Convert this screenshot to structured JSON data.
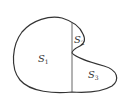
{
  "diagram": {
    "stroke_color": "#333333",
    "background": "#ffffff",
    "regions": [
      {
        "id": "S1",
        "base": "S",
        "sub": "1",
        "x": 38,
        "y": 62
      },
      {
        "id": "S2",
        "base": "S",
        "sub": "2",
        "x": 74,
        "y": 43
      },
      {
        "id": "S3",
        "base": "S",
        "sub": "3",
        "x": 88,
        "y": 78
      }
    ]
  }
}
